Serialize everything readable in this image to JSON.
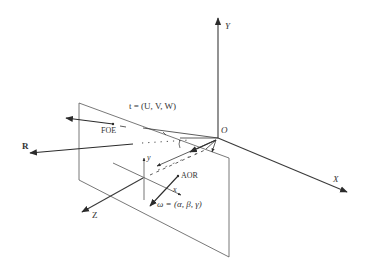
{
  "diagram": {
    "type": "3D camera coordinate system with image plane",
    "axes": {
      "X": "X",
      "Y": "Y",
      "Z": "Z",
      "origin": "O"
    },
    "image_axes": {
      "x": "x",
      "y": "y"
    },
    "vectors": {
      "translation": "t = (U, V, W)",
      "rotation": "ω = (α, β, γ)",
      "R": "R"
    },
    "points": {
      "foe": "FOE",
      "aor": "AOR"
    },
    "colors": {
      "line": "#3a3a3a",
      "arrow": "#2b2b2b",
      "background": "#ffffff"
    }
  }
}
